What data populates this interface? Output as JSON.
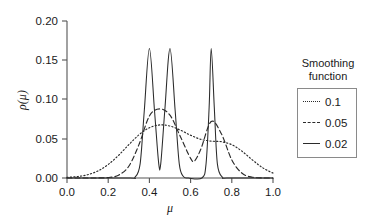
{
  "chart_data": {
    "type": "line",
    "title": "",
    "xlabel": "μ",
    "ylabel": "ρ(μ)",
    "xlim": [
      0.0,
      1.0
    ],
    "ylim": [
      0.0,
      0.2
    ],
    "xticks": [
      "0.0",
      "0.2",
      "0.4",
      "0.6",
      "0.8",
      "1.0"
    ],
    "xtick_values": [
      0.0,
      0.2,
      0.4,
      0.6,
      0.8,
      1.0
    ],
    "yticks": [
      "0.00",
      "0.05",
      "0.10",
      "0.15",
      "0.20"
    ],
    "ytick_values": [
      0.0,
      0.05,
      0.1,
      0.15,
      0.2
    ],
    "grid": false,
    "legend_position": "right-outside",
    "legend_title": "Smoothing function",
    "peak_centers": [
      0.4,
      0.5,
      0.7
    ],
    "series": [
      {
        "name": "0.1",
        "style": "dotted",
        "color": "#2b2b2b",
        "sigma": 0.1,
        "peak_value": 0.068,
        "points": [
          [
            0.0,
            0.0008
          ],
          [
            0.05,
            0.0018
          ],
          [
            0.1,
            0.0042
          ],
          [
            0.15,
            0.009
          ],
          [
            0.2,
            0.0172
          ],
          [
            0.25,
            0.0288
          ],
          [
            0.3,
            0.0424
          ],
          [
            0.35,
            0.0552
          ],
          [
            0.4,
            0.064
          ],
          [
            0.45,
            0.0676
          ],
          [
            0.5,
            0.0662
          ],
          [
            0.55,
            0.061
          ],
          [
            0.6,
            0.0545
          ],
          [
            0.65,
            0.0492
          ],
          [
            0.7,
            0.047
          ],
          [
            0.75,
            0.0462
          ],
          [
            0.8,
            0.0424
          ],
          [
            0.85,
            0.034
          ],
          [
            0.9,
            0.023
          ],
          [
            0.95,
            0.013
          ],
          [
            1.0,
            0.0062
          ]
        ]
      },
      {
        "name": "0.05",
        "style": "dashed",
        "color": "#2b2b2b",
        "sigma": 0.05,
        "peak_value": 0.088,
        "points": [
          [
            0.0,
            0.0
          ],
          [
            0.05,
            0.0
          ],
          [
            0.1,
            0.0
          ],
          [
            0.15,
            0.0001
          ],
          [
            0.2,
            0.0006
          ],
          [
            0.25,
            0.0036
          ],
          [
            0.3,
            0.015
          ],
          [
            0.35,
            0.043
          ],
          [
            0.4,
            0.079
          ],
          [
            0.45,
            0.088
          ],
          [
            0.5,
            0.08
          ],
          [
            0.55,
            0.053
          ],
          [
            0.6,
            0.025
          ],
          [
            0.62,
            0.022
          ],
          [
            0.65,
            0.037
          ],
          [
            0.7,
            0.072
          ],
          [
            0.75,
            0.056
          ],
          [
            0.8,
            0.023
          ],
          [
            0.85,
            0.006
          ],
          [
            0.9,
            0.001
          ],
          [
            0.95,
            0.0001
          ],
          [
            1.0,
            0.0
          ]
        ]
      },
      {
        "name": "0.02",
        "style": "solid",
        "color": "#2b2b2b",
        "sigma": 0.02,
        "peak_value": 0.165,
        "points": [
          [
            0.0,
            0.0
          ],
          [
            0.3,
            0.0
          ],
          [
            0.33,
            0.001
          ],
          [
            0.355,
            0.018
          ],
          [
            0.375,
            0.085
          ],
          [
            0.4,
            0.165
          ],
          [
            0.425,
            0.085
          ],
          [
            0.445,
            0.019
          ],
          [
            0.455,
            0.018
          ],
          [
            0.475,
            0.087
          ],
          [
            0.5,
            0.165
          ],
          [
            0.525,
            0.086
          ],
          [
            0.545,
            0.018
          ],
          [
            0.565,
            0.002
          ],
          [
            0.59,
            0.0
          ],
          [
            0.655,
            0.0
          ],
          [
            0.675,
            0.018
          ],
          [
            0.69,
            0.09
          ],
          [
            0.7,
            0.165
          ],
          [
            0.715,
            0.09
          ],
          [
            0.73,
            0.018
          ],
          [
            0.755,
            0.001
          ],
          [
            0.78,
            0.0
          ],
          [
            1.0,
            0.0
          ]
        ]
      }
    ]
  },
  "legend": {
    "title_line1": "Smoothing",
    "title_line2": "function",
    "entries": [
      {
        "label": "0.1",
        "style": "dotted"
      },
      {
        "label": "0.05",
        "style": "dashed"
      },
      {
        "label": "0.02",
        "style": "solid"
      }
    ]
  },
  "axes": {
    "y_label": "ρ(μ)",
    "x_label": "μ",
    "ytick_labels": [
      "0.20",
      "0.15",
      "0.10",
      "0.05",
      "0.00"
    ],
    "xtick_labels": [
      "0.0",
      "0.2",
      "0.4",
      "0.6",
      "0.8",
      "1.0"
    ]
  },
  "colors": {
    "axis": "#555555",
    "curve": "#2b2b2b",
    "text": "#1a1a1a",
    "legend_border": "#8a8a8a",
    "background": "#ffffff"
  }
}
